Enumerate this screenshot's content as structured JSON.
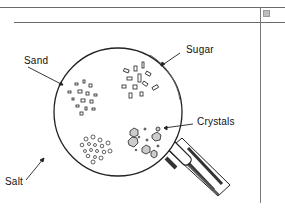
{
  "figure": {
    "type": "magnifying-glass-illustration",
    "labels": {
      "sand": "Sand",
      "sugar": "Sugar",
      "crystals": "Crystals",
      "salt": "Salt"
    }
  },
  "icons": {
    "corner": "grid-square-icon"
  },
  "colors": {
    "line": "#222222",
    "rule": "#6a6a6a",
    "icon": "#bdbdbd"
  }
}
